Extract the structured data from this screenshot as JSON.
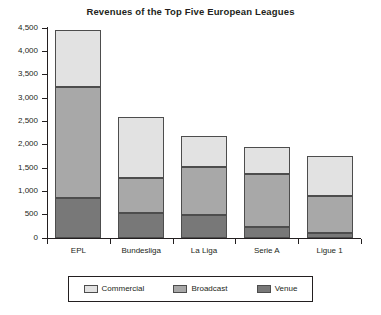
{
  "chart_data": {
    "type": "bar",
    "title": "Revenues of the Top Five European Leagues",
    "xlabel": "",
    "ylabel": "",
    "stacked": true,
    "grid": false,
    "legend_position": "bottom",
    "categories": [
      "EPL",
      "Bundesliga",
      "La Liga",
      "Serie A",
      "Ligue 1"
    ],
    "ylim": [
      0,
      4500
    ],
    "yticks": [
      0,
      500,
      1000,
      1500,
      2000,
      2500,
      3000,
      3500,
      4000,
      4500
    ],
    "ytick_labels": [
      "0",
      "500",
      "1,000",
      "1,500",
      "2,000",
      "2,500",
      "3,000",
      "3,500",
      "4,000",
      "4,500"
    ],
    "series": [
      {
        "name": "Venue",
        "color": "#787878",
        "values": [
          860,
          535,
          500,
          230,
          100
        ]
      },
      {
        "name": "Broadcast",
        "color": "#a8a8a8",
        "values": [
          2370,
          750,
          1030,
          1140,
          790
        ]
      },
      {
        "name": "Commercial",
        "color": "#e2e2e2",
        "values": [
          1220,
          1315,
          660,
          590,
          860
        ]
      }
    ],
    "totals": [
      4450,
      2600,
      2190,
      1960,
      1750
    ]
  },
  "legend": {
    "items": [
      {
        "label": "Commercial",
        "color": "#e2e2e2"
      },
      {
        "label": "Broadcast",
        "color": "#a8a8a8"
      },
      {
        "label": "Venue",
        "color": "#787878"
      }
    ]
  }
}
